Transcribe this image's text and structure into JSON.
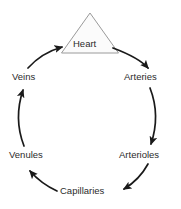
{
  "diagram": {
    "background_color": "#ffffff",
    "stroke_color": "#1a1a1a",
    "text_color": "#2b2b2b",
    "heart": {
      "label": "Heart",
      "shape": "triangle",
      "fill_color": "#fbfbfb",
      "outline_color": "#9a9a9a"
    },
    "nodes": [
      {
        "id": "heart",
        "label": "Heart",
        "position": "top"
      },
      {
        "id": "arteries",
        "label": "Arteries",
        "position": "right-upper"
      },
      {
        "id": "arterioles",
        "label": "Arterioles",
        "position": "right-lower"
      },
      {
        "id": "capillaries",
        "label": "Capillaries",
        "position": "bottom"
      },
      {
        "id": "venules",
        "label": "Venules",
        "position": "left-lower"
      },
      {
        "id": "veins",
        "label": "Veins",
        "position": "left-upper"
      }
    ],
    "flow": [
      {
        "from": "heart",
        "to": "arteries",
        "direction": "clockwise"
      },
      {
        "from": "arteries",
        "to": "arterioles",
        "direction": "clockwise"
      },
      {
        "from": "arterioles",
        "to": "capillaries",
        "direction": "clockwise"
      },
      {
        "from": "capillaries",
        "to": "venules",
        "direction": "clockwise"
      },
      {
        "from": "venules",
        "to": "veins",
        "direction": "clockwise"
      },
      {
        "from": "veins",
        "to": "heart",
        "direction": "clockwise"
      }
    ]
  }
}
